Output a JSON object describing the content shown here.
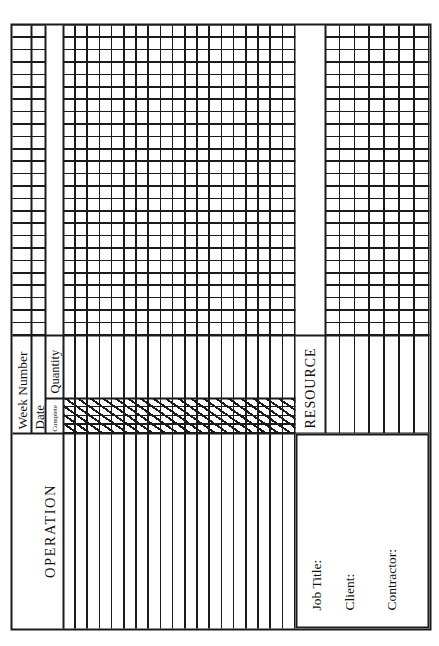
{
  "palette": {
    "paper": "#ffffff",
    "ink": "#1b1b1b"
  },
  "form": {
    "operation_label": "OPERATION",
    "week_number_label": "Week Number",
    "date_label": "Date",
    "complete_label": "Complete",
    "quantity_label": "Quantity",
    "resource_label": "RESOURCE",
    "title_block": {
      "job_title_label": "Job Title:",
      "client_label": "Client:",
      "contractor_label": "Contractor:"
    },
    "grid": {
      "week_columns": 25,
      "operation_rows": 19,
      "resource_rows": 7,
      "complete_subcolumns": 4
    }
  }
}
